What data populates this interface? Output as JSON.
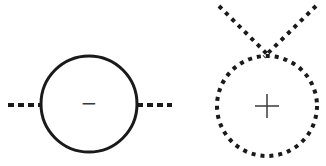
{
  "diagram": {
    "type": "feynman-style loop diagrams",
    "stroke_color": "#1a1a1a",
    "sign_color": "#3a3a3a",
    "background": "#ffffff",
    "left_figure": {
      "description": "Solid circle with dashed horizontal external lines on both sides",
      "circle": {
        "cx": 89,
        "cy": 104,
        "r": 48,
        "style": "solid"
      },
      "external_lines": [
        {
          "x1": 8,
          "y1": 105,
          "x2": 41,
          "y2": 105,
          "style": "dashed"
        },
        {
          "x1": 137,
          "y1": 105,
          "x2": 172,
          "y2": 105,
          "style": "dashed"
        }
      ],
      "sign": "−"
    },
    "right_figure": {
      "description": "Dotted circle with two dotted lines crossing at its top",
      "circle": {
        "cx": 267,
        "cy": 106,
        "r": 50,
        "style": "dotted"
      },
      "external_lines": [
        {
          "x1": 219,
          "y1": 6,
          "x2": 270,
          "y2": 57,
          "style": "dotted"
        },
        {
          "x1": 316,
          "y1": 6,
          "x2": 264,
          "y2": 57,
          "style": "dotted"
        }
      ],
      "sign": "+"
    }
  }
}
